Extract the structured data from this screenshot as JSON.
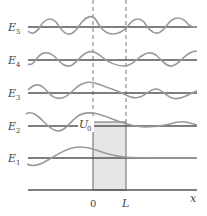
{
  "diagram": {
    "energy_levels": [
      {
        "name": "E",
        "sub": "5",
        "y": 27
      },
      {
        "name": "E",
        "sub": "4",
        "y": 60
      },
      {
        "name": "E",
        "sub": "3",
        "y": 93
      },
      {
        "name": "E",
        "sub": "2",
        "y": 126
      },
      {
        "name": "E",
        "sub": "1",
        "y": 158
      }
    ],
    "barrier_label": {
      "name": "U",
      "sub": "0"
    },
    "axis": {
      "origin_label": "0",
      "width_label": "L",
      "axis_label": "x"
    },
    "colors": {
      "line": "#555555",
      "wave": "#9a9a9a",
      "barrier": "#e6e6e6",
      "dashed": "#777777"
    }
  }
}
